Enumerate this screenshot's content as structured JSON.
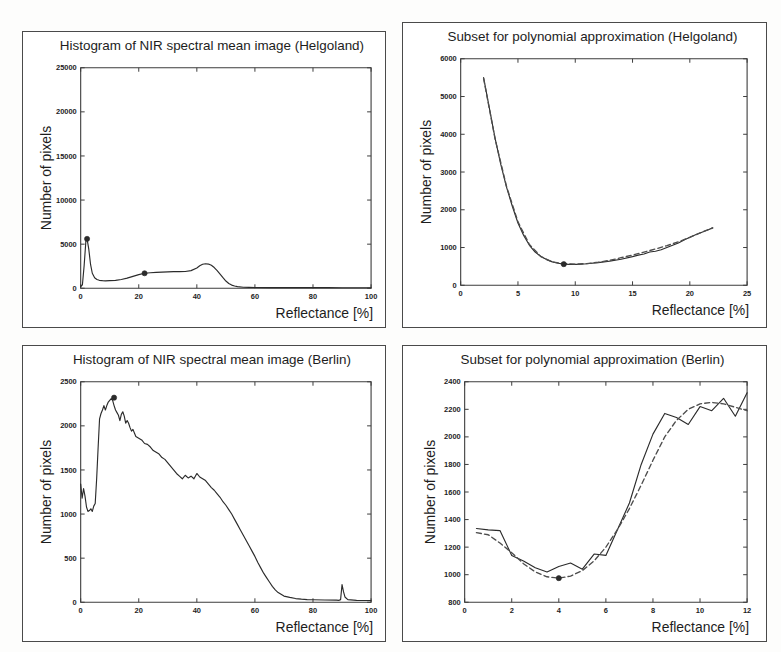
{
  "figure": {
    "background_color": "#fdfdfc",
    "line_color": "#2b2b2b",
    "fit_color": "#4d4d4d",
    "border_color": "#4a4a4a",
    "panel_count": 4
  },
  "panels": [
    {
      "id": "histogram-helgoland",
      "title": "Histogram of NIR spectral mean image (Helgoland)",
      "xlabel": "Reflectance [%]",
      "ylabel": "Number of pixels"
    },
    {
      "id": "subset-helgoland",
      "title": "Subset for polynomial approximation (Helgoland)",
      "xlabel": "Reflectance [%]",
      "ylabel": "Number of pixels"
    },
    {
      "id": "histogram-berlin",
      "title": "Histogram of NIR spectral mean image (Berlin)",
      "xlabel": "Reflectance [%]",
      "ylabel": "Number of pixels"
    },
    {
      "id": "subset-berlin",
      "title": "Subset for polynomial approximation (Berlin)",
      "xlabel": "Reflectance [%]",
      "ylabel": "Number of pixels"
    }
  ],
  "chart_data": [
    {
      "id": "histogram-helgoland",
      "type": "line",
      "title": "Histogram of NIR spectral mean image (Helgoland)",
      "xlabel": "Reflectance [%]",
      "ylabel": "Number of pixels",
      "xlim": [
        0,
        100
      ],
      "ylim": [
        0,
        25000
      ],
      "xticks": [
        0,
        20,
        40,
        60,
        80,
        100
      ],
      "xtick_labels": [
        "0",
        "20",
        "40",
        "60",
        "80",
        "100"
      ],
      "yticks": [
        0,
        5000,
        10000,
        15000,
        20000,
        25000
      ],
      "ytick_labels": [
        "0",
        "5000",
        "10000",
        "15000",
        "20000",
        "25000"
      ],
      "grid": false,
      "legend": "none",
      "series": [
        {
          "name": "histogram",
          "style": "solid",
          "x": [
            0,
            0.6,
            1.2,
            1.8,
            2.2,
            2.8,
            3.4,
            4.0,
            4.8,
            5.6,
            6.4,
            7.5,
            8.5,
            10,
            12,
            14,
            16,
            18,
            20,
            22,
            24,
            26,
            28,
            30,
            32,
            34,
            36,
            38,
            40,
            41,
            42,
            43,
            44,
            45,
            46,
            47,
            48,
            49,
            50,
            51,
            52,
            53,
            54,
            56,
            58,
            60,
            65,
            70,
            75,
            80,
            85,
            90,
            95,
            100
          ],
          "y": [
            200,
            400,
            2600,
            5400,
            5600,
            4400,
            2700,
            1700,
            1200,
            1000,
            900,
            860,
            840,
            860,
            900,
            1000,
            1150,
            1350,
            1550,
            1700,
            1760,
            1800,
            1830,
            1850,
            1880,
            1880,
            1900,
            2000,
            2300,
            2550,
            2720,
            2780,
            2740,
            2600,
            2350,
            2000,
            1600,
            1200,
            820,
            540,
            360,
            250,
            180,
            120,
            100,
            90,
            80,
            75,
            70,
            68,
            66,
            64,
            62,
            60
          ]
        }
      ],
      "markers": [
        {
          "x": 2.2,
          "y": 5600,
          "label": "peak"
        },
        {
          "x": 22,
          "y": 1700,
          "label": "subset-start"
        }
      ]
    },
    {
      "id": "subset-helgoland",
      "type": "line",
      "title": "Subset for polynomial approximation (Helgoland)",
      "xlabel": "Reflectance [%]",
      "ylabel": "Number of pixels",
      "xlim": [
        0,
        25
      ],
      "ylim": [
        0,
        6000
      ],
      "xticks": [
        0,
        5,
        10,
        15,
        20,
        25
      ],
      "xtick_labels": [
        "0",
        "5",
        "10",
        "15",
        "20",
        "25"
      ],
      "yticks": [
        0,
        1000,
        2000,
        3000,
        4000,
        5000,
        6000
      ],
      "ytick_labels": [
        "0",
        "1000",
        "2000",
        "3000",
        "4000",
        "5000",
        "6000"
      ],
      "grid": false,
      "legend": "none",
      "series": [
        {
          "name": "histogram subset",
          "style": "solid",
          "x": [
            2.0,
            2.5,
            3.0,
            3.5,
            4.0,
            4.5,
            5.0,
            5.5,
            6.0,
            6.5,
            7.0,
            7.5,
            8.0,
            8.5,
            9.0,
            9.5,
            10.0,
            10.5,
            11.0,
            12.0,
            13.0,
            14.0,
            15.0,
            15.5,
            16.0,
            16.5,
            17.0,
            17.5,
            18.0,
            18.5,
            19.0,
            19.5,
            20.0,
            20.5,
            21.0,
            21.5,
            22.0
          ],
          "y": [
            5500,
            4700,
            3900,
            3200,
            2600,
            2100,
            1650,
            1320,
            1060,
            880,
            760,
            680,
            620,
            585,
            560,
            555,
            555,
            560,
            570,
            600,
            640,
            690,
            760,
            800,
            830,
            880,
            900,
            940,
            1000,
            1060,
            1120,
            1200,
            1270,
            1340,
            1400,
            1460,
            1520
          ]
        },
        {
          "name": "polynomial fit",
          "style": "dashed",
          "x": [
            2.0,
            3.0,
            4.0,
            5.0,
            6.0,
            7.0,
            8.0,
            9.0,
            10.0,
            11.0,
            12.0,
            13.0,
            14.0,
            15.0,
            16.0,
            17.0,
            18.0,
            19.0,
            20.0,
            21.0,
            22.0
          ],
          "y": [
            5480,
            3880,
            2620,
            1680,
            1080,
            760,
            620,
            575,
            560,
            575,
            610,
            660,
            730,
            800,
            880,
            960,
            1050,
            1150,
            1270,
            1400,
            1520
          ]
        }
      ],
      "markers": [
        {
          "x": 9.0,
          "y": 560,
          "label": "minimum"
        }
      ]
    },
    {
      "id": "histogram-berlin",
      "type": "line",
      "title": "Histogram of NIR spectral mean image (Berlin)",
      "xlabel": "Reflectance [%]",
      "ylabel": "Number of pixels",
      "xlim": [
        0,
        100
      ],
      "ylim": [
        0,
        2500
      ],
      "xticks": [
        0,
        20,
        40,
        60,
        80,
        100
      ],
      "xtick_labels": [
        "0",
        "20",
        "40",
        "60",
        "80",
        "100"
      ],
      "yticks": [
        0,
        500,
        1000,
        1500,
        2000,
        2500
      ],
      "ytick_labels": [
        "0",
        "500",
        "1000",
        "1500",
        "2000",
        "2500"
      ],
      "grid": false,
      "legend": "none",
      "series": [
        {
          "name": "histogram",
          "style": "solid",
          "x": [
            0,
            0.5,
            1,
            1.5,
            2,
            2.5,
            3,
            3.5,
            4,
            4.5,
            5,
            5.5,
            6,
            6.5,
            7,
            7.5,
            8,
            8.5,
            9,
            9.5,
            10,
            10.5,
            11,
            11.5,
            12,
            12.5,
            13,
            13.5,
            14,
            14.5,
            15,
            15.5,
            16,
            16.5,
            17,
            17.5,
            18,
            18.5,
            19,
            20,
            21,
            22,
            23,
            24,
            25,
            26,
            27,
            28,
            29,
            30,
            31,
            32,
            33,
            34,
            35,
            36,
            37,
            38,
            39,
            40,
            41,
            42,
            43,
            44,
            45,
            46,
            47,
            48,
            49,
            50,
            51,
            52,
            53,
            54,
            55,
            56,
            57,
            58,
            59,
            60,
            61,
            62,
            63,
            64,
            65,
            66,
            67,
            68,
            69,
            70,
            72,
            74,
            76,
            78,
            80,
            84,
            88,
            89,
            89.5,
            90,
            90.5,
            91,
            92,
            95,
            100
          ],
          "y": [
            1340,
            1180,
            1290,
            1200,
            1080,
            1030,
            1040,
            1060,
            1030,
            1090,
            1120,
            1400,
            1750,
            2080,
            2140,
            2180,
            2230,
            2180,
            2230,
            2270,
            2290,
            2310,
            2290,
            2230,
            2180,
            2150,
            2120,
            2060,
            2130,
            2160,
            2110,
            2030,
            2060,
            2030,
            1980,
            1940,
            1960,
            1920,
            1880,
            1860,
            1840,
            1800,
            1790,
            1760,
            1720,
            1700,
            1680,
            1640,
            1620,
            1580,
            1540,
            1500,
            1460,
            1430,
            1400,
            1440,
            1410,
            1430,
            1400,
            1460,
            1420,
            1400,
            1380,
            1340,
            1300,
            1270,
            1230,
            1190,
            1140,
            1100,
            1050,
            1000,
            940,
            880,
            820,
            760,
            700,
            640,
            580,
            520,
            450,
            390,
            330,
            280,
            230,
            180,
            140,
            110,
            90,
            70,
            55,
            42,
            35,
            30,
            28,
            26,
            24,
            22,
            30,
            200,
            120,
            60,
            30,
            22,
            20,
            18,
            15
          ]
        }
      ],
      "markers": [
        {
          "x": 11.5,
          "y": 2320,
          "label": "peak"
        }
      ]
    },
    {
      "id": "subset-berlin",
      "type": "line",
      "title": "Subset for polynomial approximation (Berlin)",
      "xlabel": "Reflectance [%]",
      "ylabel": "Number of pixels",
      "xlim": [
        0,
        12
      ],
      "ylim": [
        800,
        2400
      ],
      "xticks": [
        0,
        2,
        4,
        6,
        8,
        10,
        12
      ],
      "xtick_labels": [
        "0",
        "2",
        "4",
        "6",
        "8",
        "10",
        "12"
      ],
      "yticks": [
        800,
        1000,
        1200,
        1400,
        1600,
        1800,
        2000,
        2200,
        2400
      ],
      "ytick_labels": [
        "800",
        "1000",
        "1200",
        "1400",
        "1600",
        "1800",
        "2000",
        "2200",
        "2400"
      ],
      "grid": false,
      "legend": "none",
      "series": [
        {
          "name": "histogram subset",
          "style": "solid",
          "x": [
            0.5,
            1.0,
            1.5,
            2.0,
            2.5,
            3.0,
            3.5,
            4.0,
            4.5,
            5.0,
            5.5,
            6.0,
            6.5,
            7.0,
            7.5,
            8.0,
            8.5,
            9.0,
            9.5,
            10.0,
            10.5,
            11.0,
            11.5,
            12.0
          ],
          "y": [
            1335,
            1325,
            1320,
            1140,
            1100,
            1050,
            1020,
            1060,
            1085,
            1040,
            1150,
            1140,
            1330,
            1520,
            1800,
            2020,
            2170,
            2140,
            2090,
            2220,
            2190,
            2280,
            2150,
            2320
          ]
        },
        {
          "name": "polynomial fit",
          "style": "dashed",
          "x": [
            0.5,
            1.0,
            1.5,
            2.0,
            2.5,
            3.0,
            3.5,
            4.0,
            4.5,
            5.0,
            5.5,
            6.0,
            6.5,
            7.0,
            7.5,
            8.0,
            8.5,
            9.0,
            9.5,
            10.0,
            10.5,
            11.0,
            11.5,
            12.0
          ],
          "y": [
            1305,
            1290,
            1230,
            1160,
            1080,
            1020,
            985,
            975,
            990,
            1030,
            1100,
            1200,
            1330,
            1480,
            1650,
            1830,
            2000,
            2120,
            2200,
            2240,
            2250,
            2240,
            2215,
            2190
          ]
        }
      ],
      "markers": [
        {
          "x": 4.0,
          "y": 975,
          "label": "minimum"
        }
      ]
    }
  ]
}
